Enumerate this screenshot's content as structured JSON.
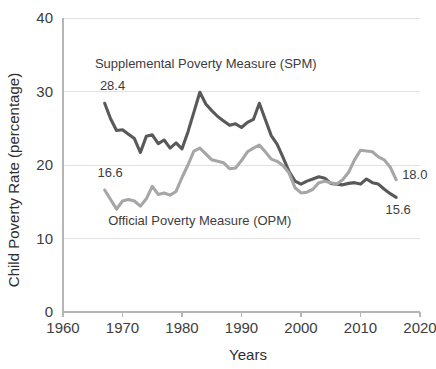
{
  "chart_data": {
    "type": "line",
    "title": "",
    "xlabel": "Years",
    "ylabel": "Child Poverty Rate (percentage)",
    "xlim": [
      1960,
      2020
    ],
    "ylim": [
      0,
      40
    ],
    "xticks": [
      1960,
      1970,
      1980,
      1990,
      2000,
      2010,
      2020
    ],
    "yticks": [
      0,
      10,
      20,
      30,
      40
    ],
    "grid": true,
    "legend_position": "inline-annotations",
    "x": [
      1967,
      1968,
      1969,
      1970,
      1971,
      1972,
      1973,
      1974,
      1975,
      1976,
      1977,
      1978,
      1979,
      1980,
      1981,
      1982,
      1983,
      1984,
      1985,
      1986,
      1987,
      1988,
      1989,
      1990,
      1991,
      1992,
      1993,
      1994,
      1995,
      1996,
      1997,
      1998,
      1999,
      2000,
      2001,
      2002,
      2003,
      2004,
      2005,
      2006,
      2007,
      2008,
      2009,
      2010,
      2011,
      2012,
      2013,
      2014,
      2015,
      2016
    ],
    "series": [
      {
        "name": "Supplemental Poverty Measure (SPM)",
        "color": "#595959",
        "values": [
          28.4,
          26.3,
          24.7,
          24.8,
          24.2,
          23.6,
          21.7,
          23.9,
          24.1,
          22.9,
          23.4,
          22.3,
          23.0,
          22.2,
          24.5,
          27.2,
          29.9,
          28.3,
          27.4,
          26.6,
          26.0,
          25.4,
          25.6,
          25.1,
          25.8,
          26.2,
          28.4,
          26.2,
          24.0,
          22.8,
          21.0,
          19.1,
          17.8,
          17.4,
          17.8,
          18.1,
          18.4,
          18.2,
          17.5,
          17.4,
          17.3,
          17.5,
          17.6,
          17.4,
          18.1,
          17.6,
          17.4,
          16.7,
          16.1,
          15.6
        ]
      },
      {
        "name": "Official Poverty Measure (OPM)",
        "color": "#a6a6a6",
        "values": [
          16.6,
          15.3,
          14.0,
          15.1,
          15.3,
          15.1,
          14.4,
          15.4,
          17.1,
          16.0,
          16.2,
          15.9,
          16.4,
          18.3,
          20.0,
          21.9,
          22.3,
          21.5,
          20.7,
          20.5,
          20.3,
          19.5,
          19.6,
          20.6,
          21.8,
          22.3,
          22.7,
          21.8,
          20.8,
          20.5,
          19.9,
          18.9,
          16.9,
          16.2,
          16.3,
          16.7,
          17.6,
          17.8,
          17.6,
          17.4,
          18.0,
          19.0,
          20.7,
          22.0,
          21.9,
          21.8,
          21.1,
          20.7,
          19.7,
          18.0
        ]
      }
    ],
    "annotations": [
      {
        "name": "spm-series-label",
        "text": "Supplemental Poverty Measure (SPM)",
        "x": 1984,
        "y": 33.2
      },
      {
        "name": "opm-series-label",
        "text": "Official Poverty Measure (OPM)",
        "x": 1983,
        "y": 11.9
      },
      {
        "name": "spm-start-value",
        "text": "28.4",
        "x": 1966.2,
        "y": 30.2
      },
      {
        "name": "opm-start-value",
        "text": "16.6",
        "x": 1965.8,
        "y": 18.4
      },
      {
        "name": "opm-end-value",
        "text": "18.0",
        "x": 2017.0,
        "y": 18.1
      },
      {
        "name": "spm-end-value",
        "text": "15.6",
        "x": 2014.2,
        "y": 13.4
      }
    ]
  }
}
